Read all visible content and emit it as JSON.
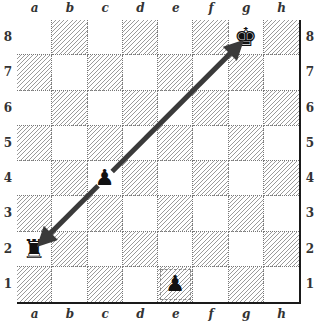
{
  "board": {
    "files": [
      "a",
      "b",
      "c",
      "d",
      "e",
      "f",
      "g",
      "h"
    ],
    "ranks": [
      "8",
      "7",
      "6",
      "5",
      "4",
      "3",
      "2",
      "1"
    ],
    "pieces": [
      {
        "square": "g8",
        "type": "king",
        "color": "black",
        "glyph": "♚"
      },
      {
        "square": "c4",
        "type": "pawn",
        "color": "black",
        "glyph": "♟"
      },
      {
        "square": "a2",
        "type": "rook",
        "color": "black",
        "glyph": "♜"
      },
      {
        "square": "e1",
        "type": "pawn",
        "color": "black",
        "glyph": "♟"
      }
    ],
    "highlighted_squares": [
      "e1"
    ],
    "arrows": [
      {
        "from": "c4",
        "to": "g8",
        "color": "#3a3a3a"
      },
      {
        "from": "c4",
        "to": "a2",
        "color": "#3a3a3a"
      }
    ],
    "colors": {
      "border": "#1a1a1a",
      "hatch": "#9a9a9a",
      "light_square": "#ffffff",
      "arrow": "#3a3a3a"
    }
  }
}
